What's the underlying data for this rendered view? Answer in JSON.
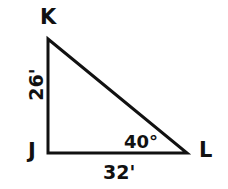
{
  "figure": {
    "kind": "geometry-diagram",
    "shape": "right-triangle",
    "background_color": "#ffffff",
    "stroke_color": "#111111",
    "text_color": "#111111",
    "stroke_width": 3
  },
  "vertices": {
    "k": {
      "label": "K",
      "x": 48,
      "y": 39
    },
    "j": {
      "label": "J",
      "x": 48,
      "y": 153
    },
    "l": {
      "label": "L",
      "x": 187,
      "y": 153
    }
  },
  "measurements": {
    "leg_vertical": "26'",
    "leg_horizontal": "32'",
    "angle_at_l": "40°"
  },
  "chart_data": {
    "type": "diagram",
    "title": "",
    "shape": "right triangle JKL",
    "points": [
      {
        "name": "K",
        "x": 48,
        "y": 39
      },
      {
        "name": "J",
        "x": 48,
        "y": 153
      },
      {
        "name": "L",
        "x": 187,
        "y": 153
      }
    ],
    "edges": [
      {
        "from": "K",
        "to": "J",
        "label": "26'"
      },
      {
        "from": "J",
        "to": "L",
        "label": "32'"
      },
      {
        "from": "L",
        "to": "K",
        "label": ""
      }
    ],
    "angles": [
      {
        "at": "L",
        "label": "40°"
      }
    ]
  }
}
